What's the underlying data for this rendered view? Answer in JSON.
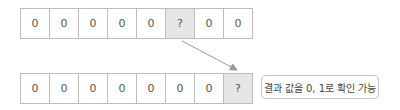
{
  "top_row": {
    "cells": [
      {
        "value": "0",
        "shaded": false
      },
      {
        "value": "0",
        "shaded": false
      },
      {
        "value": "0",
        "shaded": false
      },
      {
        "value": "0",
        "shaded": false
      },
      {
        "value": "0",
        "shaded": false
      },
      {
        "value": "?",
        "shaded": true
      },
      {
        "value": "0",
        "shaded": false
      },
      {
        "value": "0",
        "shaded": false
      }
    ]
  },
  "bottom_row": {
    "cells": [
      {
        "value": "0",
        "shaded": false
      },
      {
        "value": "0",
        "shaded": false
      },
      {
        "value": "0",
        "shaded": false
      },
      {
        "value": "0",
        "shaded": false
      },
      {
        "value": "0",
        "shaded": false
      },
      {
        "value": "0",
        "shaded": false
      },
      {
        "value": "0",
        "shaded": false
      },
      {
        "value": "?",
        "shaded": true
      }
    ]
  },
  "annotation": {
    "label": "결과 값을 0, 1로 확인 가능"
  },
  "colors": {
    "border": "#bdbdbd",
    "shaded": "#e6e6e6",
    "arrow": "#999999"
  }
}
